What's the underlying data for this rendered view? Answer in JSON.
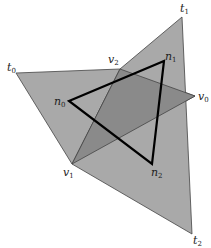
{
  "diagram": {
    "colors": {
      "polygon_fill": "#a9a9a9",
      "overlap_fill": "#8a8a8a",
      "edge": "#444444",
      "triangle_stroke": "#000000",
      "background": "#ffffff"
    },
    "points": {
      "t0": [
        16,
        73
      ],
      "t1": [
        182,
        17
      ],
      "t2": [
        192,
        234
      ],
      "v0": [
        195,
        96
      ],
      "v1": [
        72,
        164
      ],
      "v2": [
        120,
        69
      ],
      "n0": [
        69,
        101
      ],
      "n1": [
        164,
        61
      ],
      "n2": [
        152,
        164
      ]
    },
    "labels": [
      {
        "id": "t0",
        "base": "t",
        "sub": "0",
        "x": 7,
        "y": 62
      },
      {
        "id": "t1",
        "base": "t",
        "sub": "1",
        "x": 180,
        "y": 3
      },
      {
        "id": "t2",
        "base": "t",
        "sub": "2",
        "x": 193,
        "y": 235
      },
      {
        "id": "v0",
        "base": "v",
        "sub": "0",
        "x": 198,
        "y": 91
      },
      {
        "id": "v1",
        "base": "v",
        "sub": "1",
        "x": 63,
        "y": 167
      },
      {
        "id": "v2",
        "base": "v",
        "sub": "2",
        "x": 108,
        "y": 54
      },
      {
        "id": "n0",
        "base": "n",
        "sub": "0",
        "x": 54,
        "y": 96
      },
      {
        "id": "n1",
        "base": "n",
        "sub": "1",
        "x": 165,
        "y": 51
      },
      {
        "id": "n2",
        "base": "n",
        "sub": "2",
        "x": 151,
        "y": 167
      }
    ]
  }
}
